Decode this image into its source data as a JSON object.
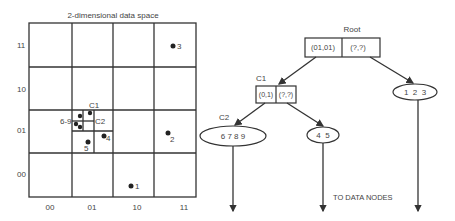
{
  "grid": {
    "title": "2-dimensional data space",
    "y_labels": [
      "11",
      "10",
      "01",
      "00"
    ],
    "x_labels": [
      "00",
      "01",
      "10",
      "11"
    ],
    "points": [
      {
        "label": "1",
        "x": 131,
        "y": 186
      },
      {
        "label": "2",
        "x": 168,
        "y": 133
      },
      {
        "label": "3",
        "x": 173,
        "y": 46
      },
      {
        "label": "4",
        "x": 104,
        "y": 136
      },
      {
        "label": "5",
        "x": 88,
        "y": 142
      }
    ],
    "cluster_points": [
      {
        "x": 80,
        "y": 116
      },
      {
        "x": 90,
        "y": 113
      },
      {
        "x": 76,
        "y": 124
      },
      {
        "x": 80,
        "y": 127
      }
    ],
    "labels": {
      "c1": "C1",
      "c2": "C2",
      "six_nine": "6-9",
      "five": "5",
      "four": "4"
    }
  },
  "tree": {
    "root": {
      "label": "Root",
      "left": "(01,01)",
      "right": "(?,?)"
    },
    "c1": {
      "label": "C1",
      "left": "(0,1)",
      "right": "(?,?)"
    },
    "c2": {
      "label": "C2",
      "content": "6 7 8 9"
    },
    "leaf_45": {
      "content": "4  5"
    },
    "leaf_123": {
      "content": "1  2  3"
    },
    "footer": "TO DATA NODES"
  }
}
